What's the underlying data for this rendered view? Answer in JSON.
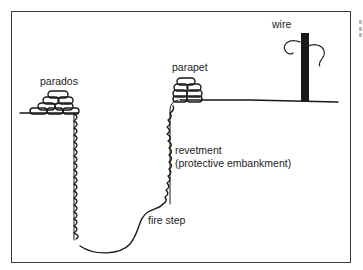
{
  "diagram": {
    "labels": {
      "parados": "parados",
      "parapet": "parapet",
      "wire": "wire",
      "revetment_line1": "revetment",
      "revetment_line2": "(protective embankment)",
      "fire_step": "fire step"
    },
    "colors": {
      "ink": "#1a1a1a",
      "frame": "#3a3a3a",
      "background": "#ffffff"
    }
  }
}
